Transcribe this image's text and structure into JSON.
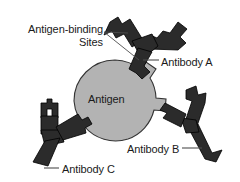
{
  "figure": {
    "background_color": "#ffffff"
  },
  "colors": {
    "antibody_fill": "#2b2b2b",
    "antibody_stroke": "#000000",
    "antigen_fill": "#b3b3b3",
    "antigen_stroke": "#333333",
    "text": "#1a1a1a",
    "leader_line": "#4d4d4d"
  },
  "labels": {
    "antigen_binding_sites_line1": "Antigen-binding",
    "antigen_binding_sites_line2": "Sites",
    "antigen": "Antigen",
    "antibody_a": "Antibody A",
    "antibody_b": "Antibody B",
    "antibody_c": "Antibody C"
  },
  "diagram_data": {
    "type": "diagram",
    "central_structure": {
      "name": "Antigen",
      "shape": "circle",
      "center": [
        115,
        101
      ],
      "radius": 41,
      "fill": "#b3b3b3",
      "epitope_bumps": 3,
      "epitope_positions": [
        "top-right",
        "right",
        "lower-left"
      ]
    },
    "antibodies": [
      {
        "name": "Antibody A",
        "shape": "Y",
        "orientation": "upper-right",
        "binding_arms": 2,
        "bound": true,
        "fill": "#2b2b2b"
      },
      {
        "name": "Antibody B",
        "shape": "Y",
        "orientation": "right",
        "binding_arms": 2,
        "bound": true,
        "fill": "#2b2b2b"
      },
      {
        "name": "Antibody C",
        "shape": "Y",
        "orientation": "lower-left",
        "binding_arms": 2,
        "bound": true,
        "fill": "#2b2b2b"
      }
    ],
    "callouts": [
      {
        "label": "Antigen-binding Sites",
        "targets": 2,
        "style": "two-line-leader"
      },
      {
        "label": "Antibody A",
        "targets": 1,
        "style": "single-leader"
      },
      {
        "label": "Antibody B",
        "targets": 1,
        "style": "single-leader"
      },
      {
        "label": "Antibody C",
        "targets": 1,
        "style": "single-leader"
      }
    ]
  }
}
